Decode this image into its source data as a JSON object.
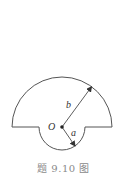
{
  "figure": {
    "caption": "题 9.10 图",
    "labels": {
      "center": "O",
      "large_radius": "b",
      "small_radius": "a"
    },
    "geometry": {
      "center": [
        62,
        127
      ],
      "large_radius_px": 50,
      "small_radius_px": 23
    },
    "colors": {
      "stroke": "#555555",
      "caption": "#8a8a8a"
    }
  }
}
